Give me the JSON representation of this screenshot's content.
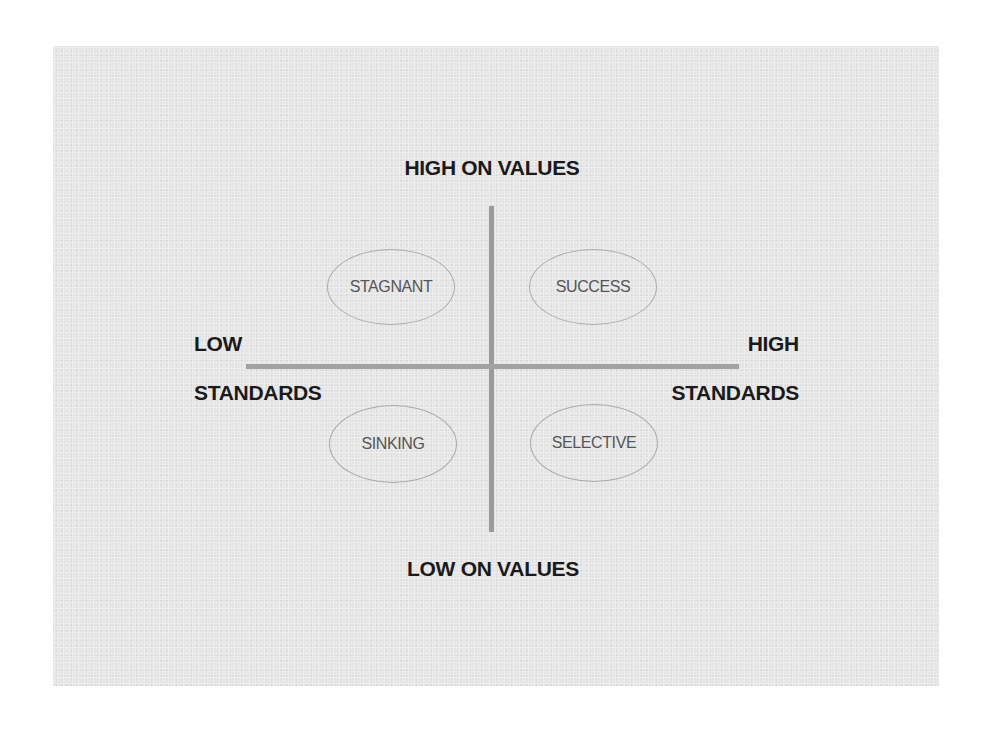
{
  "diagram": {
    "type": "2x2 quadrant matrix",
    "colors": {
      "panel_background": "#e4e4e4",
      "axis_line": "#9b9b9b",
      "axis_label_text": "#1a1a1a",
      "quadrant_text": "#555555",
      "quadrant_outline": "#aaaaaa"
    },
    "vertical_axis": {
      "top_label": "HIGH ON VALUES",
      "bottom_label": "LOW ON VALUES"
    },
    "horizontal_axis": {
      "left_label_line1": "LOW",
      "left_label_line2": "STANDARDS",
      "right_label_line1": "HIGH",
      "right_label_line2": "STANDARDS"
    },
    "quadrants": [
      {
        "position": "top-left",
        "label": "STAGNANT",
        "values": "high",
        "standards": "low"
      },
      {
        "position": "top-right",
        "label": "SUCCESS",
        "values": "high",
        "standards": "high"
      },
      {
        "position": "bottom-left",
        "label": "SINKING",
        "values": "low",
        "standards": "low"
      },
      {
        "position": "bottom-right",
        "label": "SELECTIVE",
        "values": "low",
        "standards": "high"
      }
    ]
  }
}
